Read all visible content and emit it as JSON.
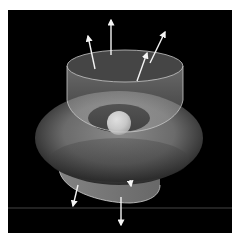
{
  "figure": {
    "background_color": "#000000",
    "page_color": "#ffffff",
    "elements": {
      "sphere": {
        "label": "central-charge",
        "color": "#e8e8e8"
      },
      "torus": {
        "label": "field-distribution",
        "color": "#6a6a6a"
      },
      "cylinder": {
        "label": "gaussian-surface",
        "color": "#a0a0a0"
      },
      "lower_disc": {
        "label": "bottom-cap",
        "color": "#8a8a8a"
      },
      "horizon_line": {
        "color": "#555555"
      }
    },
    "arrows_up_count": 4,
    "arrows_down_count": 3
  }
}
